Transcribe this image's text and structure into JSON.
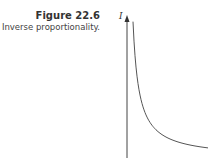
{
  "figure": {
    "title": "Figure 22.6",
    "subtitle": "Inverse proportionality."
  },
  "chart_data": {
    "type": "line",
    "title": "Figure 22.6",
    "subtitle": "Inverse proportionality.",
    "xlabel": "",
    "ylabel": "I",
    "grid": false,
    "legend": null,
    "series": [
      {
        "name": "I ∝ 1/x",
        "x": [
          1,
          1.5,
          2,
          3,
          4,
          6,
          8,
          10,
          12
        ],
        "y": [
          12,
          8,
          6,
          4,
          3,
          2,
          1.5,
          1.2,
          1
        ]
      }
    ],
    "colors": {
      "axis": "#444444",
      "curve": "#555555"
    }
  }
}
